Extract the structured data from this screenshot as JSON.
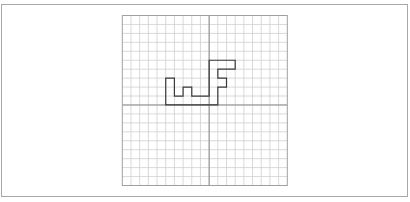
{
  "figure": {
    "frame_border_color": "#a8a8a8",
    "grid": {
      "columns": 19,
      "rows": 19,
      "x_axis_row": 10,
      "y_axis_col": 10,
      "grid_line_color": "#cfcfcf",
      "axis_line_color": "#8a8a8a",
      "border_color": "#a0a0a0"
    },
    "shape": {
      "stroke_color": "#3a3a3a",
      "vertices": [
        [
          5,
          7
        ],
        [
          6,
          7
        ],
        [
          6,
          9
        ],
        [
          7,
          9
        ],
        [
          7,
          8
        ],
        [
          8,
          8
        ],
        [
          8,
          9
        ],
        [
          10,
          9
        ],
        [
          10,
          5
        ],
        [
          13,
          5
        ],
        [
          13,
          6
        ],
        [
          11,
          6
        ],
        [
          11,
          7
        ],
        [
          12,
          7
        ],
        [
          12,
          8
        ],
        [
          11,
          8
        ],
        [
          11,
          10
        ],
        [
          5,
          10
        ]
      ]
    }
  }
}
